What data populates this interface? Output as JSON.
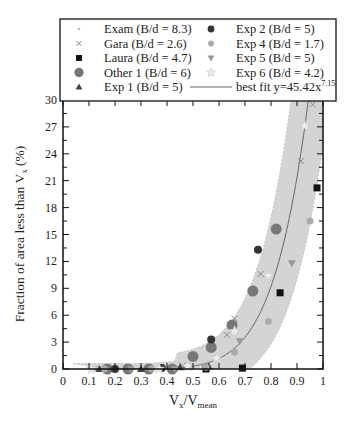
{
  "chart_data": {
    "type": "scatter",
    "title": "",
    "xlabel": "Vx/Vmean",
    "ylabel": "Fraction of area less than Vx (%)",
    "xlim": [
      0,
      1
    ],
    "ylim": [
      0,
      30
    ],
    "x_ticks": [
      "0",
      "0.1",
      "0.2",
      "0.3",
      "0.4",
      "0.5",
      "0.6",
      "0.7",
      "0.8",
      "0.9",
      "1"
    ],
    "y_ticks": [
      "0",
      "3",
      "6",
      "9",
      "12",
      "15",
      "18",
      "21",
      "24",
      "27",
      "30"
    ],
    "grid": false,
    "legend_position": "top (inside, two columns)",
    "best_fit": {
      "label": "best fit y=45.42x^7.15",
      "a": 45.42,
      "b": 7.15
    },
    "band": {
      "description": "shaded gray envelope around best fit",
      "color": "#d4d4d4"
    },
    "series": [
      {
        "name": "Exam (B/d = 8.3)",
        "marker": "dot",
        "color": "#bbbbbb",
        "points": [
          [
            0.13,
            0
          ],
          [
            0.2,
            0
          ],
          [
            0.3,
            0
          ],
          [
            0.45,
            0.1
          ]
        ]
      },
      {
        "name": "Gara (B/d = 2.6)",
        "marker": "x",
        "color": "#888888",
        "points": [
          [
            0.12,
            0
          ],
          [
            0.25,
            0
          ],
          [
            0.46,
            0.4
          ],
          [
            0.63,
            3.8
          ],
          [
            0.66,
            5.6
          ],
          [
            0.76,
            10.6
          ],
          [
            0.915,
            23.2
          ],
          [
            0.96,
            29.5
          ]
        ]
      },
      {
        "name": "Laura (B/d = 4.7)",
        "marker": "square",
        "color": "#111111",
        "points": [
          [
            0.55,
            0
          ],
          [
            0.69,
            0.1
          ],
          [
            0.835,
            8.5
          ],
          [
            0.977,
            20.2
          ]
        ]
      },
      {
        "name": "Other 1 (B/d = 6)",
        "marker": "circle-large",
        "color": "#777777",
        "points": [
          [
            0.17,
            0
          ],
          [
            0.25,
            0
          ],
          [
            0.33,
            0
          ],
          [
            0.42,
            0
          ],
          [
            0.5,
            1.4
          ],
          [
            0.57,
            2.4
          ],
          [
            0.65,
            4.9
          ],
          [
            0.73,
            8.7
          ],
          [
            0.82,
            15.6
          ]
        ]
      },
      {
        "name": "Exp 1 (B/d = 5)",
        "marker": "triangle-up",
        "color": "#444444",
        "points": [
          [
            0.14,
            0
          ],
          [
            0.3,
            0
          ],
          [
            0.45,
            0.2
          ],
          [
            0.56,
            0.3
          ]
        ]
      },
      {
        "name": "Exp 2 (B/d = 5)",
        "marker": "circle",
        "color": "#333333",
        "points": [
          [
            0.2,
            0
          ],
          [
            0.38,
            0.1
          ],
          [
            0.57,
            3.3
          ],
          [
            0.75,
            13.3
          ]
        ]
      },
      {
        "name": "Exp 4 (B/d = 1.7)",
        "marker": "circle-small",
        "color": "#aaaaaa",
        "points": [
          [
            0.16,
            0
          ],
          [
            0.34,
            0
          ],
          [
            0.55,
            0.2
          ],
          [
            0.66,
            1.9
          ],
          [
            0.79,
            5.3
          ],
          [
            0.95,
            16.5
          ]
        ]
      },
      {
        "name": "Exp 5 (B/d = 5)",
        "marker": "triangle-down",
        "color": "#999999",
        "points": [
          [
            0.26,
            0
          ],
          [
            0.43,
            0
          ],
          [
            0.68,
            3.1
          ],
          [
            0.88,
            11.8
          ]
        ]
      },
      {
        "name": "Exp 6 (B/d = 4.2)",
        "marker": "star",
        "color": "#cccccc",
        "points": [
          [
            0.11,
            0
          ],
          [
            0.37,
            0
          ],
          [
            0.48,
            0.3
          ],
          [
            0.59,
            1.2
          ],
          [
            0.66,
            4.2
          ],
          [
            0.79,
            10.4
          ],
          [
            0.93,
            27.1
          ]
        ]
      }
    ]
  },
  "legend": {
    "left": [
      "Exam (B/d = 8.3)",
      "Gara (B/d = 2.6)",
      "Laura (B/d = 4.7)",
      "Other 1 (B/d = 6)",
      "Exp 1 (B/d = 5)"
    ],
    "right": [
      "Exp 2 (B/d = 5)",
      "Exp 4 (B/d = 1.7)",
      "Exp 5 (B/d = 5)",
      "Exp 6 (B/d = 4.2)",
      "best fit y=45.42x"
    ],
    "fit_exponent": "7.15"
  },
  "axes": {
    "xlabel_main": "V",
    "xlabel_sub1": "x",
    "xlabel_slash": "/V",
    "xlabel_sub2": "mean",
    "ylabel_text": "Fraction of area less than V",
    "ylabel_sub": "x",
    "ylabel_tail": " (%)"
  }
}
